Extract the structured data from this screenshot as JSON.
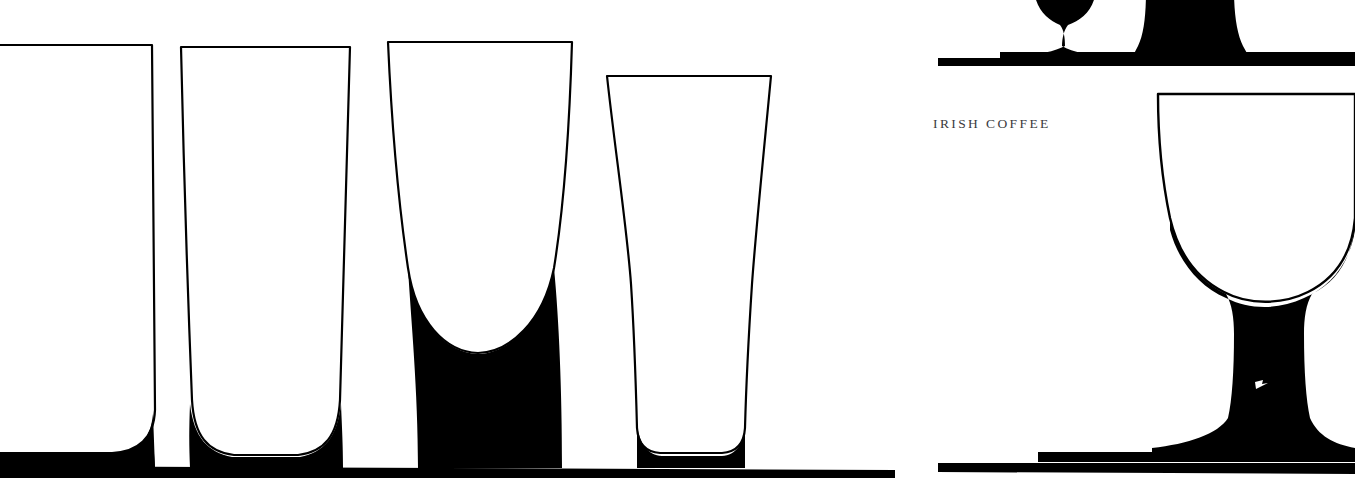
{
  "page": {
    "kind": "book-page-spread",
    "width": 1355,
    "height": 486,
    "background_color": "#ffffff",
    "ink_color": "#000000",
    "caption_color": "#3b3b40",
    "gutter": {
      "x": 897,
      "width": 41
    }
  },
  "captions": {
    "irish_coffee": "IRISH COFFEE"
  },
  "left_panel": {
    "name": "tumbler-and-pilsner-plate",
    "ground_line": {
      "y": 466,
      "x_start": 0,
      "x_end": 895,
      "thickness": 12
    },
    "glasses": [
      {
        "id": "glass-1",
        "shape_name": "highball-tumbler",
        "outline_color": "#000000",
        "base_fill": "#000000",
        "bounds": {
          "x": -40,
          "y": 44,
          "width": 195,
          "height": 424
        }
      },
      {
        "id": "glass-2",
        "shape_name": "tall-tumbler",
        "outline_color": "#000000",
        "base_fill": "#000000",
        "bounds": {
          "x": 180,
          "y": 46,
          "width": 172,
          "height": 422
        }
      },
      {
        "id": "glass-3",
        "shape_name": "tulip-pilsner",
        "outline_color": "#000000",
        "base_fill": "#000000",
        "bounds": {
          "x": 386,
          "y": 40,
          "width": 190,
          "height": 428
        }
      },
      {
        "id": "glass-4",
        "shape_name": "footed-pint",
        "outline_color": "#000000",
        "base_fill": "#000000",
        "bounds": {
          "x": 605,
          "y": 74,
          "width": 167,
          "height": 394
        }
      }
    ]
  },
  "right_panel": {
    "name": "stemware-plate",
    "shelf_line_top": {
      "y": 62,
      "x_start": 938,
      "x_end": 1355,
      "thickness": 10
    },
    "ground_line": {
      "y": 466,
      "x_start": 938,
      "x_end": 1355,
      "thickness": 10
    },
    "glasses": [
      {
        "id": "glass-5",
        "shape_name": "stemmed-goblet-cropped-top",
        "fill": "#000000",
        "note": "bowl cut off by top of page"
      },
      {
        "id": "glass-6",
        "shape_name": "stemmed-snifter-cropped-top",
        "fill": "#000000",
        "note": "bowl cut off by top of page"
      },
      {
        "id": "glass-7",
        "shape_name": "irish-coffee-stem-glass",
        "outline_color": "#000000",
        "stem_fill": "#000000",
        "bounds": {
          "x": 1157,
          "y": 92,
          "width": 230,
          "height": 376
        },
        "caption_ref": "IRISH COFFEE"
      }
    ]
  }
}
